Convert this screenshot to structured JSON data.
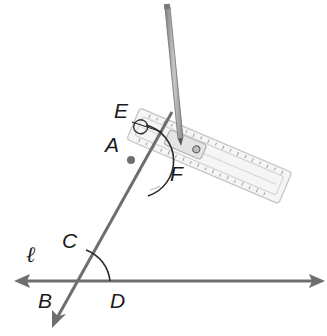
{
  "diagram": {
    "type": "geometric-construction",
    "colors": {
      "line": "#6e6e6e",
      "arc": "#2a2a2a",
      "label": "#1a1a1a",
      "ruler": "#dcdcdc",
      "pencil": "#9a9a9a"
    },
    "labels": {
      "E": "E",
      "A": "A",
      "F": "F",
      "C": "C",
      "B": "B",
      "D": "D",
      "line_l": "ℓ"
    },
    "points": [
      {
        "name": "A",
        "x": 131,
        "y": 160,
        "marked": true
      },
      {
        "name": "B",
        "x": 73,
        "y": 281
      },
      {
        "name": "C",
        "x": 86,
        "y": 252
      },
      {
        "name": "D",
        "x": 110,
        "y": 281
      },
      {
        "name": "E",
        "x": 146,
        "y": 126
      },
      {
        "name": "F",
        "x": 178,
        "y": 155
      }
    ],
    "lines": [
      {
        "name": "ℓ",
        "kind": "line",
        "from": [
          14,
          281
        ],
        "to": [
          325,
          281
        ],
        "arrows": "both"
      },
      {
        "name": "transversal",
        "kind": "ray",
        "from": [
          172,
          112
        ],
        "to": [
          52,
          328
        ],
        "arrows": "end"
      }
    ],
    "arcs": [
      {
        "name": "arc-CD",
        "center": "B",
        "from": "C",
        "to": "D"
      },
      {
        "name": "arc-EF",
        "center": "A",
        "from": "E",
        "to": "F"
      }
    ],
    "tools": [
      "compass-pencil",
      "compass-ruler"
    ]
  }
}
